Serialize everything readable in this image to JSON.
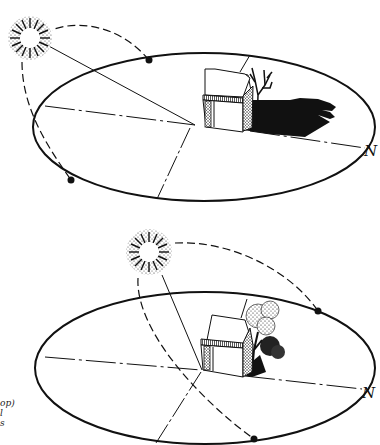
{
  "figure": {
    "type": "sun-path-diagram",
    "panels": [
      {
        "id": "top",
        "season": "winter",
        "north_label": "N",
        "sun_position": "low, south-east sky",
        "shadow": "long shadow cast to the north by house and bare tree",
        "tree": "bare (leafless)"
      },
      {
        "id": "bottom",
        "season": "summer",
        "north_label": "N",
        "sun_position": "high sky",
        "shadow": "short shadow cast by house and leafy tree",
        "tree": "in full leaf"
      }
    ],
    "caption_fragments": [
      "op)",
      "l",
      "s"
    ]
  },
  "colors": {
    "ink": "#111111",
    "background": "#ffffff"
  }
}
